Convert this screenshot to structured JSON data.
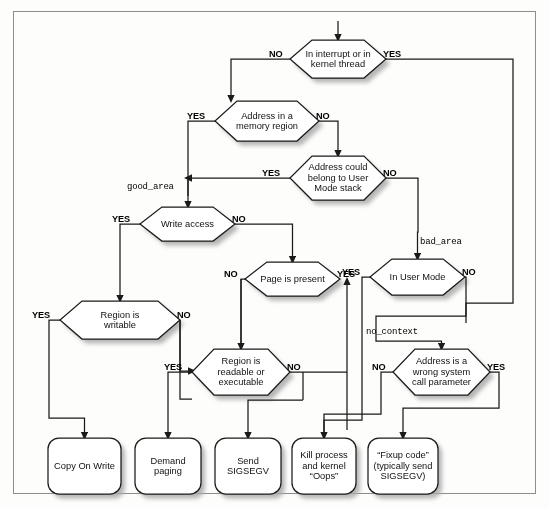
{
  "diagram": {
    "colors": {
      "stroke": "#1a1a1a",
      "fill": "#ffffff",
      "shadow": "#9a9a9a",
      "frame": "#8d8d8d",
      "background": "#fdfdfb"
    },
    "decisions": [
      {
        "id": "in-interrupt",
        "text": "In interrupt or in kernel thread",
        "lines": [
          "In interrupt or in",
          "kernel thread"
        ],
        "x": 290,
        "y": 40,
        "w": 96,
        "h": 38,
        "left_label": "NO",
        "right_label": "YES"
      },
      {
        "id": "address-in-memory-region",
        "text": "Address in a memory region",
        "lines": [
          "Address in a",
          "memory region"
        ],
        "x": 215,
        "y": 101,
        "w": 104,
        "h": 40,
        "left_label": "YES",
        "right_label": "NO"
      },
      {
        "id": "address-user-mode-stack",
        "text": "Address could belong to User Mode stack",
        "lines": [
          "Address could",
          "belong to User",
          "Mode stack"
        ],
        "x": 290,
        "y": 156,
        "w": 96,
        "h": 44,
        "left_label": "YES",
        "right_label": "NO"
      },
      {
        "id": "write-access",
        "text": "Write access",
        "lines": [
          "Write access"
        ],
        "x": 140,
        "y": 207,
        "w": 95,
        "h": 34,
        "left_label": "YES",
        "right_label": "NO"
      },
      {
        "id": "page-is-present",
        "text": "Page is present",
        "lines": [
          "Page is present"
        ],
        "x": 245,
        "y": 262,
        "w": 95,
        "h": 34,
        "left_label": "NO",
        "right_label": "YES"
      },
      {
        "id": "in-user-mode",
        "text": "In User Mode",
        "lines": [
          "In User Mode"
        ],
        "x": 370,
        "y": 259,
        "w": 95,
        "h": 36,
        "left_label": "YES",
        "right_label": "NO"
      },
      {
        "id": "region-is-writable",
        "text": "Region is writable",
        "lines": [
          "Region is",
          "writable"
        ],
        "x": 60,
        "y": 301,
        "w": 120,
        "h": 38,
        "left_label": "YES",
        "right_label": "NO"
      },
      {
        "id": "region-readable-executable",
        "text": "Region is readable or executable",
        "lines": [
          "Region is",
          "readable or",
          "executable"
        ],
        "x": 192,
        "y": 349,
        "w": 98,
        "h": 46,
        "left_label": "YES",
        "right_label": "NO"
      },
      {
        "id": "wrong-syscall-parameter",
        "text": "Address is a wrong system call parameter",
        "lines": [
          "Address is a",
          "wrong system",
          "call parameter"
        ],
        "x": 393,
        "y": 349,
        "w": 97,
        "h": 46,
        "left_label": "NO",
        "right_label": "YES"
      }
    ],
    "terminals": [
      {
        "id": "copy-on-write",
        "text": "Copy On Write",
        "lines": [
          "Copy On Write"
        ],
        "x": 48,
        "y": 438,
        "w": 73,
        "h": 56
      },
      {
        "id": "demand-paging",
        "text": "Demand paging",
        "lines": [
          "Demand",
          "paging"
        ],
        "x": 135,
        "y": 438,
        "w": 66,
        "h": 56
      },
      {
        "id": "send-sigsegv",
        "text": "Send SIGSEGV",
        "lines": [
          "Send",
          "SIGSEGV"
        ],
        "x": 215,
        "y": 438,
        "w": 66,
        "h": 56
      },
      {
        "id": "kill-process-oops",
        "text": "Kill process and kernel \"Oops\"",
        "lines": [
          "Kill process",
          "and kernel",
          "“Oops”"
        ],
        "x": 292,
        "y": 438,
        "w": 64,
        "h": 56
      },
      {
        "id": "fixup-code",
        "text": "\"Fixup code\" (typically send SIGSEGV)",
        "lines": [
          "“Fixup code”",
          "(typically send",
          "SIGSEGV)"
        ],
        "x": 368,
        "y": 438,
        "w": 70,
        "h": 56
      }
    ],
    "code_labels": [
      {
        "id": "good-area",
        "text": "good_area",
        "x": 127,
        "y": 182
      },
      {
        "id": "bad-area",
        "text": "bad_area",
        "x": 420,
        "y": 237
      },
      {
        "id": "no_context",
        "text": "no_context",
        "x": 366,
        "y": 327
      }
    ]
  }
}
